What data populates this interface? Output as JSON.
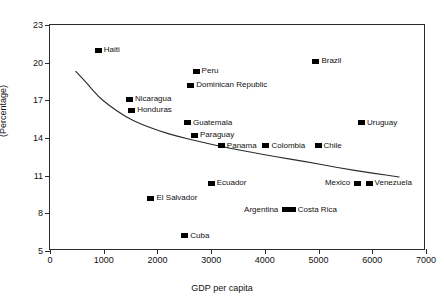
{
  "figure": {
    "top_caption": "",
    "background": "#ffffff",
    "marker_color": "#000000",
    "axis_color": "#2b2b2b"
  },
  "chart_data": {
    "type": "scatter",
    "title": "",
    "xlabel": "GDP per capita",
    "ylabel": "(Percentage)",
    "xlim": [
      0,
      7000
    ],
    "ylim": [
      5,
      23
    ],
    "xticks": [
      0,
      1000,
      2000,
      3000,
      4000,
      5000,
      6000,
      7000
    ],
    "yticks": [
      5,
      8,
      11,
      14,
      17,
      20,
      23
    ],
    "xtick_labels": [
      "0",
      "1000",
      "2000",
      "3000",
      "4000",
      "5000",
      "6000",
      "7000"
    ],
    "ytick_labels": [
      "5",
      "8",
      "11",
      "14",
      "17",
      "20",
      "23"
    ],
    "grid": false,
    "legend": "none",
    "points": [
      {
        "label": "Haiti",
        "x": 900,
        "y": 21.0,
        "label_side": "right"
      },
      {
        "label": "Brazil",
        "x": 4950,
        "y": 20.1,
        "label_side": "right"
      },
      {
        "label": "Peru",
        "x": 2720,
        "y": 19.3,
        "label_side": "right"
      },
      {
        "label": "Dominican Republic",
        "x": 2620,
        "y": 18.2,
        "label_side": "right"
      },
      {
        "label": "Nicaragua",
        "x": 1480,
        "y": 17.1,
        "label_side": "right"
      },
      {
        "label": "Honduras",
        "x": 1520,
        "y": 16.2,
        "label_side": "right"
      },
      {
        "label": "Guatemala",
        "x": 2560,
        "y": 15.2,
        "label_side": "right"
      },
      {
        "label": "Uruguay",
        "x": 5800,
        "y": 15.2,
        "label_side": "right"
      },
      {
        "label": "Paraguay",
        "x": 2690,
        "y": 14.2,
        "label_side": "right"
      },
      {
        "label": "Panama",
        "x": 3190,
        "y": 13.4,
        "label_side": "right"
      },
      {
        "label": "Colombia",
        "x": 4020,
        "y": 13.4,
        "label_side": "right"
      },
      {
        "label": "Chile",
        "x": 4990,
        "y": 13.4,
        "label_side": "right"
      },
      {
        "label": "Ecuador",
        "x": 3000,
        "y": 10.4,
        "label_side": "right"
      },
      {
        "label": "Mexico",
        "x": 5730,
        "y": 10.4,
        "label_side": "left"
      },
      {
        "label": "Venezuela",
        "x": 5940,
        "y": 10.4,
        "label_side": "right"
      },
      {
        "label": "El Salvador",
        "x": 1880,
        "y": 9.2,
        "label_side": "right"
      },
      {
        "label": "Argentina",
        "x": 4390,
        "y": 8.3,
        "label_side": "left"
      },
      {
        "label": "Costa Rica",
        "x": 4510,
        "y": 8.3,
        "label_side": "right"
      },
      {
        "label": "Cuba",
        "x": 2510,
        "y": 6.2,
        "label_side": "right"
      }
    ],
    "trend_curve": {
      "name": "fitted-trend",
      "points": [
        {
          "x": 480,
          "y": 19.3
        },
        {
          "x": 700,
          "y": 18.3
        },
        {
          "x": 900,
          "y": 17.3
        },
        {
          "x": 1100,
          "y": 16.6
        },
        {
          "x": 1400,
          "y": 15.7
        },
        {
          "x": 1700,
          "y": 15.1
        },
        {
          "x": 2000,
          "y": 14.6
        },
        {
          "x": 2400,
          "y": 14.1
        },
        {
          "x": 2800,
          "y": 13.7
        },
        {
          "x": 3200,
          "y": 13.3
        },
        {
          "x": 3700,
          "y": 12.9
        },
        {
          "x": 4200,
          "y": 12.5
        },
        {
          "x": 4800,
          "y": 12.1
        },
        {
          "x": 5400,
          "y": 11.6
        },
        {
          "x": 6000,
          "y": 11.2
        },
        {
          "x": 6500,
          "y": 10.9
        }
      ]
    }
  }
}
